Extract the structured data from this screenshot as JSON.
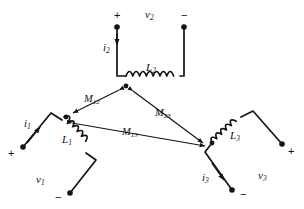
{
  "figure": {
    "type": "circuit-diagram",
    "line_color": "#141414",
    "text_color": "#111111",
    "background": "#ffffff"
  },
  "coils": [
    {
      "id": "L1",
      "label": "L",
      "subscript": "1",
      "position": "left",
      "dot_terminal": "top"
    },
    {
      "id": "L2",
      "label": "L",
      "subscript": "2",
      "position": "top",
      "dot_terminal": "left"
    },
    {
      "id": "L3",
      "label": "L",
      "subscript": "3",
      "position": "right",
      "dot_terminal": "left"
    }
  ],
  "voltages": [
    {
      "id": "v1",
      "label": "v",
      "subscript": "1",
      "plus": "+",
      "minus": "−"
    },
    {
      "id": "v2",
      "label": "v",
      "subscript": "2",
      "plus": "+",
      "minus": "−"
    },
    {
      "id": "v3",
      "label": "v",
      "subscript": "3",
      "plus": "+",
      "minus": "−"
    }
  ],
  "currents": [
    {
      "id": "i1",
      "label": "i",
      "subscript": "1",
      "direction": "up-right"
    },
    {
      "id": "i2",
      "label": "i",
      "subscript": "2",
      "direction": "down"
    },
    {
      "id": "i3",
      "label": "i",
      "subscript": "3",
      "direction": "down-right"
    }
  ],
  "mutual_inductances": [
    {
      "id": "M12",
      "label": "M",
      "subscript": "12",
      "between": "L1-L2"
    },
    {
      "id": "M23",
      "label": "M",
      "subscript": "23",
      "between": "L2-L3"
    },
    {
      "id": "M13",
      "label": "M",
      "subscript": "13",
      "between": "L1-L3"
    }
  ]
}
